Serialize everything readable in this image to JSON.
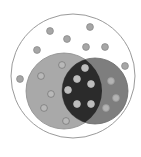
{
  "diagram": {
    "type": "venn",
    "universe": {
      "cx": 73,
      "cy": 76,
      "r": 62,
      "stroke": "#9a9a9a",
      "fill": "#ffffff"
    },
    "sets": [
      {
        "name": "A",
        "cx": 64,
        "cy": 91,
        "r": 38,
        "fill": "#a9a9a9",
        "stroke": "#8a8a8a"
      },
      {
        "name": "B",
        "cx": 95,
        "cy": 91,
        "r": 33,
        "fill": "#7e7e7e",
        "stroke": "#6a6a6a"
      }
    ],
    "intersection_fill": "#2b2b2b",
    "dot_radius": 3.4,
    "dots": {
      "outside": [
        [
          50,
          31
        ],
        [
          90,
          27
        ],
        [
          67,
          39
        ],
        [
          37,
          50
        ],
        [
          86,
          47
        ],
        [
          105,
          47
        ],
        [
          125,
          66
        ],
        [
          20,
          79
        ]
      ],
      "a_only": [
        [
          62,
          65
        ],
        [
          41,
          76
        ],
        [
          51,
          94
        ],
        [
          44,
          108
        ],
        [
          66,
          121
        ]
      ],
      "both": [
        [
          85,
          68
        ],
        [
          77,
          79
        ],
        [
          91,
          84
        ],
        [
          68,
          90
        ],
        [
          77,
          104
        ],
        [
          91,
          104
        ]
      ],
      "b_only": [
        [
          111,
          81
        ],
        [
          116,
          98
        ],
        [
          106,
          108
        ]
      ]
    },
    "dot_styles": {
      "outside": {
        "fill": "#a6a6a6",
        "stroke": "#8c8c8c"
      },
      "a_only": {
        "fill": "#b8b8b8",
        "stroke": "#7a7a7a"
      },
      "both": {
        "fill": "#bdbdbd",
        "stroke": "#bdbdbd"
      },
      "b_only": {
        "fill": "#b3b3b3",
        "stroke": "#9a9a9a"
      }
    }
  }
}
